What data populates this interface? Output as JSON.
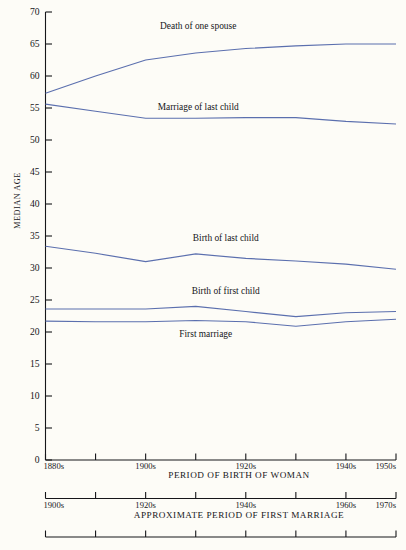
{
  "chart_data": {
    "type": "line",
    "title": "",
    "ylabel": "MEDIAN AGE",
    "ylim": [
      0,
      70
    ],
    "ytick_step": 5,
    "yticks": [
      0,
      5,
      10,
      15,
      20,
      25,
      30,
      35,
      40,
      45,
      50,
      55,
      60,
      65,
      70
    ],
    "grid": false,
    "legend_position": "inline-annotations",
    "line_color": "#5b6fae",
    "background_color": "#fdfcf7",
    "axis_color": "#16161a",
    "categories": [
      "1880s",
      "1890s",
      "1900s",
      "1910s",
      "1920s",
      "1930s",
      "1940s",
      "1950s"
    ],
    "primary_xlabel": "PERIOD OF BIRTH OF WOMAN",
    "primary_xticks": [
      "1880s",
      "",
      "1900s",
      "",
      "1920s",
      "",
      "1940s",
      "1950s"
    ],
    "secondary_xlabel": "APPROXIMATE PERIOD OF FIRST MARRIAGE",
    "secondary_xticks": [
      "1900s",
      "",
      "1920s",
      "",
      "1940s",
      "",
      "1960s",
      "1970s"
    ],
    "tertiary_xticks": [
      "",
      "",
      "",
      "",
      "",
      "",
      "",
      ""
    ],
    "series": [
      {
        "name": "Death of one spouse",
        "label_x_category_index": 3.05,
        "label_y_value": 67.6,
        "values": [
          57.3,
          60.0,
          62.5,
          63.6,
          64.3,
          64.7,
          65.0,
          65.0
        ]
      },
      {
        "name": "Marriage of last child",
        "label_x_category_index": 3.05,
        "label_y_value": 55.0,
        "values": [
          55.6,
          54.5,
          53.4,
          53.4,
          53.5,
          53.5,
          52.9,
          52.5
        ]
      },
      {
        "name": "Birth of last child",
        "label_x_category_index": 3.6,
        "label_y_value": 34.6,
        "values": [
          33.4,
          32.3,
          31.0,
          32.2,
          31.5,
          31.1,
          30.6,
          29.8
        ]
      },
      {
        "name": "Birth of first child",
        "label_x_category_index": 3.6,
        "label_y_value": 26.2,
        "values": [
          23.6,
          23.6,
          23.6,
          24.0,
          23.2,
          22.4,
          23.0,
          23.2
        ]
      },
      {
        "name": "First marriage",
        "label_x_category_index": 3.2,
        "label_y_value": 19.5,
        "values": [
          21.7,
          21.6,
          21.6,
          21.8,
          21.6,
          20.9,
          21.6,
          22.0
        ]
      }
    ]
  }
}
